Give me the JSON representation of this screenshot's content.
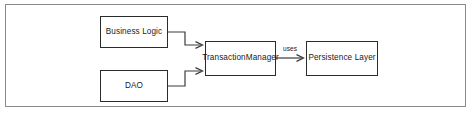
{
  "diagram": {
    "title": "",
    "border_color": "#8a8a8a",
    "node_border_color": "#2b2b2b",
    "edge_color": "#3a3a3a",
    "background": "#ffffff",
    "nodes": [
      {
        "id": "business-logic",
        "label": "Business Logic"
      },
      {
        "id": "dao",
        "label": "DAO"
      },
      {
        "id": "transaction-manager",
        "label": "TransactionManager"
      },
      {
        "id": "persistence-layer",
        "label": "Persistence Layer"
      }
    ],
    "edges": [
      {
        "id": "business-logic-to-transaction-manager",
        "from": "business-logic",
        "to": "transaction-manager",
        "label": ""
      },
      {
        "id": "dao-to-transaction-manager",
        "from": "dao",
        "to": "transaction-manager",
        "label": ""
      },
      {
        "id": "transaction-manager-to-persistence-layer",
        "from": "transaction-manager",
        "to": "persistence-layer",
        "label": "uses"
      }
    ]
  }
}
